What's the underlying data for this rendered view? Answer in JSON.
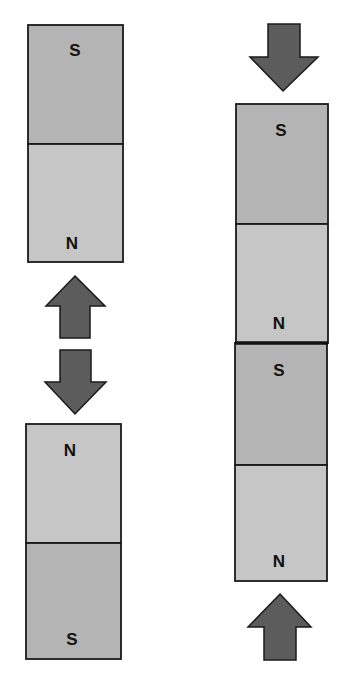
{
  "diagram": {
    "colors": {
      "background": "#ffffff",
      "magnet_dark": "#b4b4b4",
      "magnet_light": "#c6c6c6",
      "outline": "#1a1a1a",
      "arrow_fill": "#5c5c5c"
    },
    "left_group": {
      "top_magnet": {
        "top_label": "S",
        "bottom_label": "N"
      },
      "bottom_magnet": {
        "top_label": "N",
        "bottom_label": "S"
      },
      "arrows": [
        "up",
        "down"
      ]
    },
    "right_group": {
      "top_magnet": {
        "top_label": "S",
        "bottom_label": "N"
      },
      "bottom_magnet": {
        "top_label": "S",
        "bottom_label": "N"
      },
      "arrows": [
        "down",
        "up"
      ]
    }
  }
}
